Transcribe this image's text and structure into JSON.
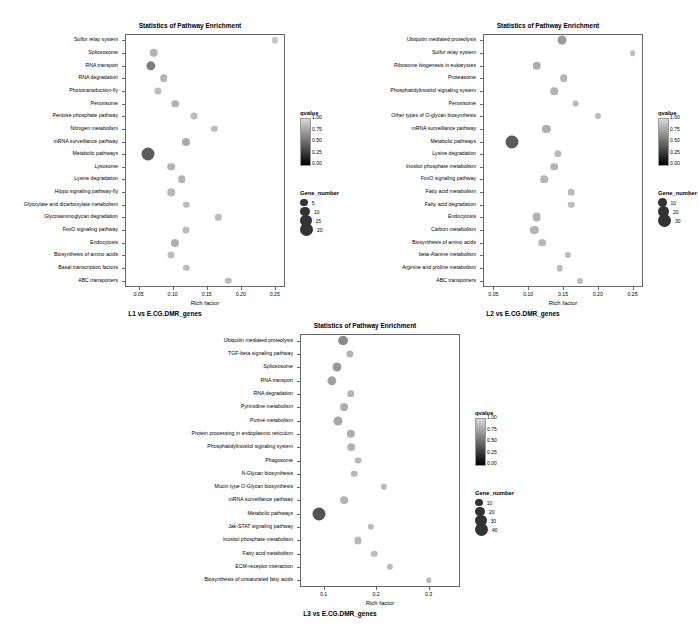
{
  "panels": [
    {
      "title": "Statistics of Pathway Enrichment",
      "caption": "L1 vs E.CG.DMR_genes",
      "xlabel": "Rich factor",
      "xticks": [
        "0.05",
        "0.10",
        "0.15",
        "0.20",
        "0.25"
      ],
      "xlim": [
        0.03,
        0.265
      ],
      "legend_qvalue_title": "qvalue",
      "legend_qvalue_labels": [
        "1.00",
        "0.75",
        "0.50",
        "0.25",
        "0.00"
      ],
      "legend_size_title": "Gene_number",
      "legend_size_labels": [
        "5",
        "10",
        "15",
        "20"
      ],
      "chart_data": {
        "type": "scatter",
        "title": "Statistics of Pathway Enrichment",
        "xlabel": "Rich factor",
        "ylabel": "",
        "categories": [
          "Sulfur relay system",
          "Spliceosome",
          "RNA transport",
          "RNA degradation",
          "Phototransduction-fly",
          "Peroxisome",
          "Pentose phosphate pathway",
          "Nitrogen metabolism",
          "mRNA surveillance pathway",
          "Metabolic pathways",
          "Lysosome",
          "Lysine degradation",
          "Hippo signaling pathway-fly",
          "Glyoxylate and dicarboxylate metabolism",
          "Glycosaminoglycan degradation",
          "FoxO signaling pathway",
          "Endocytosis",
          "Biosynthesis of amino acids",
          "Basal transcription factors",
          "ABC transporters"
        ],
        "rich_factor": [
          0.25,
          0.072,
          0.068,
          0.087,
          0.079,
          0.104,
          0.131,
          0.161,
          0.12,
          0.064,
          0.098,
          0.113,
          0.098,
          0.12,
          0.167,
          0.12,
          0.104,
          0.098,
          0.12,
          0.182
        ],
        "gene_number": [
          3,
          7,
          9,
          5,
          4,
          5,
          4,
          3,
          6,
          21,
          5,
          5,
          5,
          3,
          3,
          4,
          6,
          4,
          3,
          3
        ],
        "qvalue": [
          0.95,
          0.85,
          0.55,
          0.85,
          0.9,
          0.85,
          0.9,
          0.9,
          0.8,
          0.35,
          0.85,
          0.85,
          0.88,
          0.9,
          0.9,
          0.9,
          0.82,
          0.9,
          0.9,
          0.9
        ]
      }
    },
    {
      "title": "Statistics of Pathway Enrichment",
      "caption": "L2 vs E.CG.DMR_genes",
      "xlabel": "Rich factor",
      "xticks": [
        "0.05",
        "0.10",
        "0.15",
        "0.20",
        "0.25"
      ],
      "xlim": [
        0.035,
        0.265
      ],
      "legend_qvalue_title": "qvalue",
      "legend_qvalue_labels": [
        "1.00",
        "0.75",
        "0.50",
        "0.25",
        "0.00"
      ],
      "legend_size_title": "Gene_number",
      "legend_size_labels": [
        "10",
        "20",
        "30"
      ],
      "chart_data": {
        "type": "scatter",
        "title": "Statistics of Pathway Enrichment",
        "xlabel": "Rich factor",
        "ylabel": "",
        "categories": [
          "Ubiquitin mediated proteolysis",
          "Sulfur relay system",
          "Ribosome biogenesis in eukaryotes",
          "Proteasome",
          "Phosphatidylinositol signaling system",
          "Peroxisome",
          "Other types of O-glycan biosynthesis",
          "mRNA surveillance pathway",
          "Metabolic pathways",
          "Lysine degradation",
          "Inositol phosphate metabolism",
          "FoxO signaling pathway",
          "Fatty acid metabolism",
          "Fatty acid degradation",
          "Endocytosis",
          "Carbon metabolism",
          "Biosynthesis of amino acids",
          "beta-Alanine metabolism",
          "Arginine and proline metabolism",
          "ABC transporters"
        ],
        "rich_factor": [
          0.148,
          0.25,
          0.112,
          0.151,
          0.137,
          0.168,
          0.2,
          0.126,
          0.077,
          0.143,
          0.137,
          0.123,
          0.162,
          0.162,
          0.112,
          0.109,
          0.12,
          0.157,
          0.145,
          0.174
        ],
        "gene_number": [
          13,
          3,
          11,
          8,
          8,
          6,
          4,
          10,
          33,
          7,
          8,
          8,
          5,
          5,
          12,
          10,
          8,
          4,
          5,
          4
        ],
        "qvalue": [
          0.72,
          0.9,
          0.82,
          0.85,
          0.85,
          0.88,
          0.9,
          0.82,
          0.35,
          0.88,
          0.86,
          0.86,
          0.9,
          0.9,
          0.84,
          0.86,
          0.88,
          0.9,
          0.9,
          0.9
        ]
      }
    },
    {
      "title": "Statistics of Pathway Enrichment",
      "caption": "L3 vs E.CG.DMR_genes",
      "xlabel": "Rich factor",
      "xticks": [
        "0.1",
        "0.2",
        "0.3"
      ],
      "xlim": [
        0.055,
        0.36
      ],
      "legend_qvalue_title": "qvalue",
      "legend_qvalue_labels": [
        "1.00",
        "0.75",
        "0.50",
        "0.25",
        "0.00"
      ],
      "legend_size_title": "Gene_number",
      "legend_size_labels": [
        "10",
        "20",
        "30",
        "40"
      ],
      "chart_data": {
        "type": "scatter",
        "title": "Statistics of Pathway Enrichment",
        "xlabel": "Rich factor",
        "ylabel": "",
        "categories": [
          "Ubiquitin mediated proteolysis",
          "TGF-beta signaling pathway",
          "Spliceosome",
          "RNA transport",
          "RNA degradation",
          "Pyrimidine metabolism",
          "Purine metabolism",
          "Protein processing in endoplasmic reticulum",
          "Phosphatidylinositol signaling system",
          "Phagosome",
          "N-Glycan biosynthesis",
          "Mucin type O-Glycan biosynthesis",
          "mRNA surveillance pathway",
          "Metabolic pathways",
          "Jak-STAT signaling pathway",
          "Inositol phosphate metabolism",
          "Fatty acid metabolism",
          "ECM-receptor interaction",
          "Biosynthesis of unsaturated fatty acids"
        ],
        "rich_factor": [
          0.137,
          0.15,
          0.126,
          0.116,
          0.152,
          0.139,
          0.127,
          0.152,
          0.152,
          0.165,
          0.158,
          0.215,
          0.139,
          0.091,
          0.19,
          0.165,
          0.196,
          0.227,
          0.3
        ],
        "gene_number": [
          22,
          9,
          18,
          19,
          10,
          12,
          18,
          14,
          11,
          8,
          7,
          6,
          11,
          45,
          6,
          9,
          7,
          6,
          4
        ],
        "qvalue": [
          0.62,
          0.85,
          0.7,
          0.75,
          0.85,
          0.82,
          0.78,
          0.82,
          0.85,
          0.88,
          0.88,
          0.88,
          0.85,
          0.3,
          0.9,
          0.88,
          0.9,
          0.9,
          0.9
        ]
      }
    }
  ]
}
